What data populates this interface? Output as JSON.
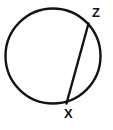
{
  "figure": {
    "kind": "circle-with-chord-diagram",
    "background_color": "#ffffff",
    "stroke_color": "#131313",
    "canvas": {
      "width": 113,
      "height": 130
    }
  },
  "circle": {
    "name": "circle",
    "center_x": 53,
    "center_y": 56,
    "radius": 47.5,
    "stroke_width": 2.4,
    "fill": "none",
    "stroke_color": "#131313"
  },
  "chord": {
    "name": "chord-xz",
    "x1": 88.5,
    "y1": 23.5,
    "x2": 66.5,
    "y2": 103.5,
    "stroke_width": 2.4,
    "stroke_color": "#131313"
  },
  "points": [
    {
      "id": "z",
      "label": "Z",
      "point_x": 88.5,
      "point_y": 23.5,
      "label_x": 92,
      "label_y": 6
    },
    {
      "id": "x",
      "label": "X",
      "point_x": 66.5,
      "point_y": 103.5,
      "label_x": 64,
      "label_y": 107
    }
  ]
}
